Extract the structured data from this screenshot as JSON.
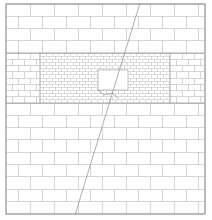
{
  "diagram": {
    "title": "Masonry wall mesh with central opening and diagonal crack",
    "width": 212,
    "height": 220,
    "frame": {
      "x": 6,
      "y": 4,
      "w": 199,
      "h": 210
    },
    "colors": {
      "background": "#ffffff",
      "frame": "#8a8a8a",
      "joints": "#b9b9b9",
      "fine_joints": "#a9a9a9",
      "crack": "#8c8c8c"
    },
    "regions": [
      {
        "name": "upper-large-blocks",
        "x": 6,
        "y": 4,
        "w": 199,
        "h": 49,
        "course_h": 12.25,
        "unit_w": 24
      },
      {
        "name": "left-medium-bricks",
        "x": 6,
        "y": 53,
        "w": 34,
        "h": 50,
        "course_h": 6.25,
        "unit_w": 12
      },
      {
        "name": "right-medium-bricks",
        "x": 170,
        "y": 53,
        "w": 35,
        "h": 50,
        "course_h": 6.25,
        "unit_w": 12
      },
      {
        "name": "central-fine-bricks",
        "x": 40,
        "y": 53,
        "w": 130,
        "h": 50,
        "course_h": 3.125,
        "unit_w": 6
      },
      {
        "name": "lower-large-blocks",
        "x": 6,
        "y": 103,
        "w": 199,
        "h": 111,
        "course_h": 12.33,
        "unit_w": 24
      }
    ],
    "opening": {
      "name": "window-opening",
      "x": 98,
      "y": 70,
      "w": 30,
      "h": 20
    },
    "crack": {
      "name": "diagonal-crack",
      "x1": 140,
      "y1": 3,
      "x2": 75,
      "y2": 215
    },
    "crack_branch": {
      "name": "crack-branch-near-opening",
      "points": [
        [
          98,
          90
        ],
        [
          104,
          95
        ],
        [
          112,
          93
        ],
        [
          118,
          98
        ]
      ]
    }
  }
}
